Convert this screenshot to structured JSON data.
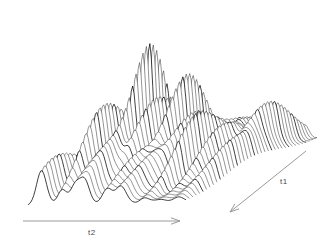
{
  "figure": {
    "type": "surface-mesh-plot",
    "background_color": "#ffffff",
    "line_color": "#1a1a1a",
    "axis_color": "#9a9a9a",
    "label_color": "#4a4a4a",
    "width": 317,
    "height": 248
  },
  "axes": {
    "t2": {
      "label": "t2",
      "arrow_direction": "right",
      "x1": 23,
      "y1": 221,
      "x2": 180,
      "y2": 221,
      "label_x": 88,
      "label_y": 228
    },
    "t1": {
      "label": "t1",
      "arrow_direction": "down-left",
      "x1": 306,
      "y1": 151,
      "x2": 230,
      "y2": 212,
      "label_x": 280,
      "label_y": 177
    }
  },
  "chart_data": {
    "type": "surface",
    "title": "",
    "xlabel": "t2",
    "ylabel": "t1",
    "zlabel": "",
    "grid": false,
    "legend": null,
    "projection": {
      "origin_x": 28,
      "origin_y": 208,
      "t2_span_x": 158,
      "t1_step_x": 3.35,
      "t1_step_y": -1.62,
      "z_scale": 118,
      "rows": 40,
      "cols": 110
    },
    "xlim": [
      0,
      1
    ],
    "ylim": [
      0,
      1
    ],
    "zlim": [
      0,
      1
    ],
    "peaks": [
      {
        "t2": 0.085,
        "t1": 0.1,
        "amp": 0.33,
        "wx": 0.03,
        "wy": 0.16
      },
      {
        "t2": 0.13,
        "t1": 0.42,
        "amp": 0.22,
        "wx": 0.034,
        "wy": 0.2
      },
      {
        "t2": 0.215,
        "t1": 0.3,
        "amp": 0.62,
        "wx": 0.028,
        "wy": 0.17
      },
      {
        "t2": 0.25,
        "t1": 0.62,
        "amp": 0.3,
        "wx": 0.032,
        "wy": 0.19
      },
      {
        "t2": 0.3,
        "t1": 0.2,
        "amp": 0.27,
        "wx": 0.03,
        "wy": 0.18
      },
      {
        "t2": 0.335,
        "t1": 0.52,
        "amp": 1.0,
        "wx": 0.02,
        "wy": 0.13
      },
      {
        "t2": 0.36,
        "t1": 0.18,
        "amp": 0.34,
        "wx": 0.03,
        "wy": 0.17
      },
      {
        "t2": 0.42,
        "t1": 0.45,
        "amp": 0.55,
        "wx": 0.026,
        "wy": 0.16
      },
      {
        "t2": 0.455,
        "t1": 0.72,
        "amp": 0.28,
        "wx": 0.033,
        "wy": 0.2
      },
      {
        "t2": 0.5,
        "t1": 0.25,
        "amp": 0.3,
        "wx": 0.031,
        "wy": 0.18
      },
      {
        "t2": 0.545,
        "t1": 0.55,
        "amp": 0.74,
        "wx": 0.024,
        "wy": 0.15
      },
      {
        "t2": 0.59,
        "t1": 0.22,
        "amp": 0.26,
        "wx": 0.032,
        "wy": 0.19
      },
      {
        "t2": 0.645,
        "t1": 0.48,
        "amp": 0.44,
        "wx": 0.028,
        "wy": 0.17
      },
      {
        "t2": 0.69,
        "t1": 0.78,
        "amp": 0.24,
        "wx": 0.034,
        "wy": 0.21
      },
      {
        "t2": 0.735,
        "t1": 0.38,
        "amp": 0.52,
        "wx": 0.026,
        "wy": 0.16
      },
      {
        "t2": 0.79,
        "t1": 0.68,
        "amp": 0.3,
        "wx": 0.031,
        "wy": 0.19
      },
      {
        "t2": 0.845,
        "t1": 0.45,
        "amp": 0.36,
        "wx": 0.028,
        "wy": 0.18
      },
      {
        "t2": 0.905,
        "t1": 0.72,
        "amp": 0.42,
        "wx": 0.027,
        "wy": 0.17
      },
      {
        "t2": 0.955,
        "t1": 0.4,
        "amp": 0.3,
        "wx": 0.03,
        "wy": 0.19
      }
    ],
    "ripple": {
      "amplitude": 0.03,
      "t2_frequency": 26.0,
      "t1_frequency": 7.0,
      "baseline": 0.045
    }
  }
}
